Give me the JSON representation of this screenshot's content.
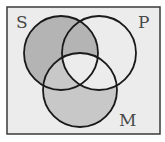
{
  "diagram": {
    "type": "venn-3-set",
    "frame": {
      "x": 7,
      "y": 7,
      "width": 153,
      "height": 127,
      "fill": "#ececec",
      "stroke": "#3a3a3a"
    },
    "sets": [
      {
        "id": "S",
        "label": "S",
        "cx": 61,
        "cy": 53,
        "r": 37,
        "label_x": 16,
        "label_y": 28
      },
      {
        "id": "P",
        "label": "P",
        "cx": 99,
        "cy": 53,
        "r": 37,
        "label_x": 138,
        "label_y": 28
      },
      {
        "id": "M",
        "label": "M",
        "cx": 80,
        "cy": 90,
        "r": 37,
        "label_x": 119,
        "label_y": 126
      }
    ],
    "regions": {
      "S_only": {
        "shaded": true,
        "color": "#b4b4b4"
      },
      "S_and_P_not_M": {
        "shaded": true,
        "color": "#b4b4b4"
      },
      "S_and_M_not_P": {
        "shaded": true,
        "color": "#c8c8c8"
      },
      "M_only": {
        "shaded": true,
        "color": "#c8c8c8"
      },
      "P_only": {
        "shaded": false,
        "color": "#ececec"
      },
      "P_and_M_not_S": {
        "shaded": false,
        "color": "#ececec"
      },
      "S_and_P_and_M": {
        "shaded": false,
        "color": "#ececec"
      }
    },
    "stroke_color": "#1a1a1a",
    "stroke_width": 1.8
  }
}
